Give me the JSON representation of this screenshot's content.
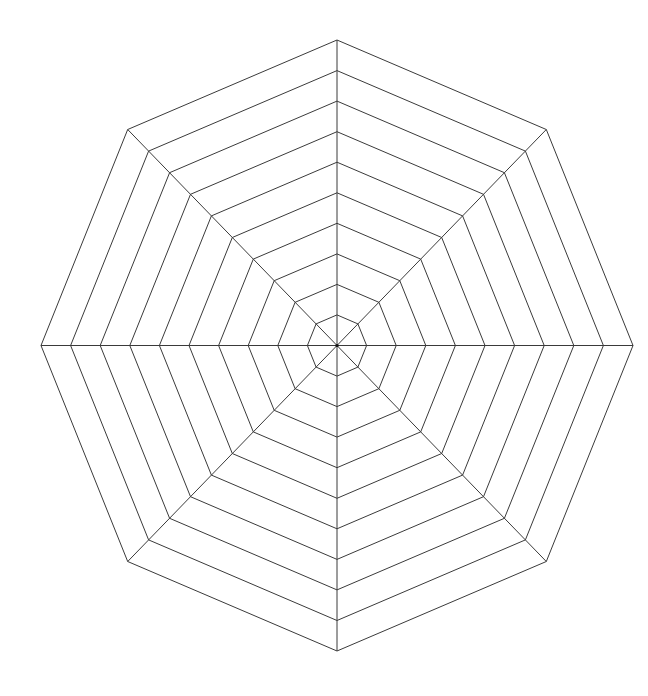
{
  "chart_data": {
    "type": "radar",
    "title": "",
    "axes": 8,
    "axis_labels": [],
    "rings": 10,
    "series": [],
    "grid": true,
    "legend": null,
    "geometry": {
      "center": [
        337,
        345.5
      ],
      "radius_x": 296,
      "radius_y": 305.5,
      "rotation_deg": 0
    },
    "colors": {
      "grid": "#3a3a3a",
      "background": "#ffffff"
    }
  }
}
